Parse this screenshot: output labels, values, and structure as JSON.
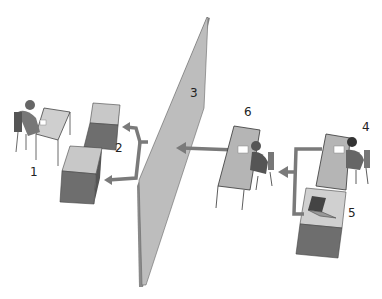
{
  "diagram": {
    "labels": {
      "n1": "1",
      "n2": "2",
      "n3": "3",
      "n4": "4",
      "n5": "5",
      "n6": "6"
    },
    "nodes": [
      {
        "id": "1",
        "description": "person seated at desk (left)"
      },
      {
        "id": "2",
        "description": "two storage boxes receiving split arrow"
      },
      {
        "id": "3",
        "description": "tall partition wall"
      },
      {
        "id": "4",
        "description": "person seated at desk (right)"
      },
      {
        "id": "5",
        "description": "box with laptop"
      },
      {
        "id": "6",
        "description": "person seated at desk (middle)"
      }
    ],
    "colors": {
      "arrow": "#7a7a7a",
      "wall_face": "#bdbdbd",
      "wall_edge": "#8a8a8a",
      "box_top": "#c8c8c8",
      "box_side": "#6e6e6e"
    }
  }
}
